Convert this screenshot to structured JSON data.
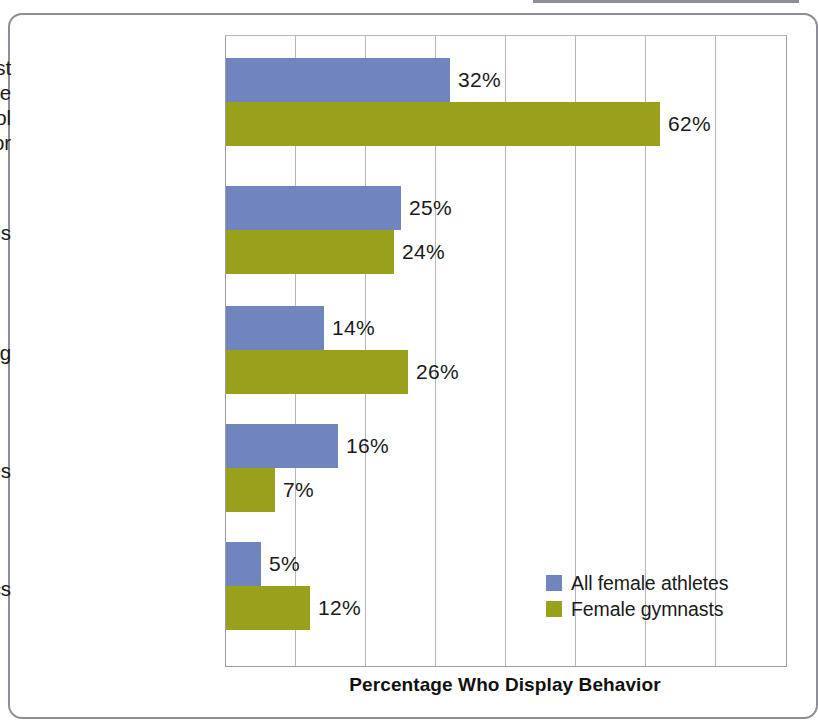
{
  "chart_data": {
    "type": "bar",
    "orientation": "horizontal",
    "title": "",
    "xlabel": "Percentage Who Display Behavior",
    "ylabel": "",
    "xlim": [
      0,
      80
    ],
    "xtick_interval": 10,
    "xticklabels": [],
    "grid": "vertical",
    "legend_position": "bottom-right-inside",
    "categories": [
      "Engage in at least one self-destructive weight-control behavior",
      "Ingest diet pills",
      "Induce vomiting",
      "Use laxatives",
      "Use diuretics"
    ],
    "category_label_lines": [
      [
        "Engage in at least",
        "one self-destructive",
        "weight-control",
        "behavior"
      ],
      [
        "Ingest diet pills"
      ],
      [
        "Induce vomiting"
      ],
      [
        "Use laxatives"
      ],
      [
        "Use diuretics"
      ]
    ],
    "series": [
      {
        "name": "All female athletes",
        "color": "#7084bd",
        "values": [
          32,
          25,
          14,
          16,
          5
        ],
        "labels": [
          "32%",
          "25%",
          "14%",
          "16%",
          "5%"
        ]
      },
      {
        "name": "Female gymnasts",
        "color": "#99a01c",
        "values": [
          62,
          24,
          26,
          7,
          12
        ],
        "labels": [
          "62%",
          "24%",
          "26%",
          "7%",
          "12%"
        ]
      }
    ]
  },
  "axis": {
    "x_title": "Percentage Who Display Behavior"
  },
  "legend": {
    "entries": [
      {
        "label": "All female athletes",
        "color": "#7084bd"
      },
      {
        "label": "Female gymnasts",
        "color": "#99a01c"
      }
    ]
  },
  "colors": {
    "series_all_female_athletes": "#7084bd",
    "series_female_gymnasts": "#99a01c",
    "gridline": "#b6b6bf",
    "axis_line": "#9b9ba5",
    "frame_border": "#8e8e9a",
    "text": "#1a1a1a",
    "background": "#ffffff"
  }
}
